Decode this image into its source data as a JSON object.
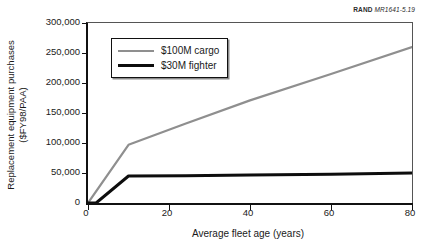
{
  "source_tag": {
    "mark": "RAND",
    "document": "MR1641-5.19"
  },
  "chart_data": {
    "type": "line",
    "title": "",
    "xlabel": "Average fleet age (years)",
    "ylabel_line1": "Replacement equipment purchases",
    "ylabel_line2": "($FY98/PAA)",
    "xlim": [
      0,
      80
    ],
    "ylim": [
      0,
      300000
    ],
    "xticks": [
      0,
      20,
      40,
      60,
      80
    ],
    "xtick_labels": [
      "0",
      "20",
      "40",
      "60",
      "80"
    ],
    "yticks": [
      0,
      50000,
      100000,
      150000,
      200000,
      250000,
      300000
    ],
    "ytick_labels": [
      "0",
      "50,000",
      "100,000",
      "150,000",
      "200,000",
      "250,000",
      "300,000"
    ],
    "grid": false,
    "legend_position": "upper-left-inside",
    "series": [
      {
        "name": "$100M cargo",
        "color": "#8f8f8f",
        "width": 2.2,
        "x": [
          0,
          10,
          24,
          40,
          60,
          80
        ],
        "y": [
          0,
          97000,
          132000,
          171000,
          215000,
          260000
        ]
      },
      {
        "name": "$30M fighter",
        "color": "#0d0d0d",
        "width": 3,
        "x": [
          0,
          2,
          10,
          24,
          40,
          60,
          80
        ],
        "y": [
          0,
          0,
          45000,
          45500,
          46500,
          48000,
          50000
        ]
      }
    ]
  }
}
